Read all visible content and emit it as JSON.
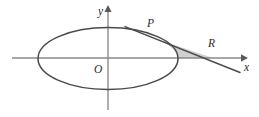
{
  "figure": {
    "kind": "geometry-diagram",
    "background_color": "#ffffff",
    "shaded_region_color": "#d0d0d0",
    "curve_color": "#4a4a4a",
    "axis_color": "#8a8a8a",
    "label_color": "#2a2a2a",
    "labels": {
      "y_axis": "y",
      "x_axis": "x",
      "origin": "O",
      "tangent_point": "P",
      "x_intercept": "R"
    },
    "label_positions": {
      "y_axis": {
        "x": 98,
        "y": 14
      },
      "x_axis": {
        "x": 245,
        "y": 70
      },
      "origin": {
        "x": 96,
        "y": 73
      },
      "tangent_point": {
        "x": 148,
        "y": 26
      },
      "x_intercept": {
        "x": 209,
        "y": 46
      }
    },
    "geometry": {
      "origin": {
        "x": 108,
        "y": 58
      },
      "ellipse": {
        "cx": 108,
        "cy": 58.5,
        "rx": 70,
        "ry": 31
      },
      "x_axis": {
        "x1": 12,
        "y1": 58,
        "x2": 246,
        "y2": 58
      },
      "y_axis": {
        "x1": 108,
        "y1": 10,
        "x2": 108,
        "y2": 110
      },
      "tangent_line": {
        "x1": 125,
        "y1": 26,
        "x2": 240,
        "y2": 72
      },
      "tangent_point_P": {
        "x": 161,
        "y": 40.4
      },
      "point_R": {
        "x": 213,
        "y": 58
      },
      "ellipse_right_vertex": {
        "x": 178,
        "y": 58
      }
    }
  }
}
